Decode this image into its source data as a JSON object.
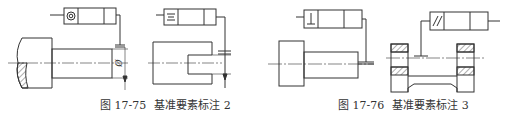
{
  "figures": [
    {
      "id": "17-75",
      "caption_number": "图 17-75",
      "caption_title": "基准要素标注 2",
      "symbols": [
        "concentricity",
        "symmetry"
      ],
      "dimension_label": "Ø"
    },
    {
      "id": "17-76",
      "caption_number": "图 17-76",
      "caption_title": "基准要素标注 3",
      "symbols": [
        "perpendicularity",
        "parallelism"
      ]
    }
  ],
  "colors": {
    "line": "#333333",
    "background": "#ffffff"
  }
}
